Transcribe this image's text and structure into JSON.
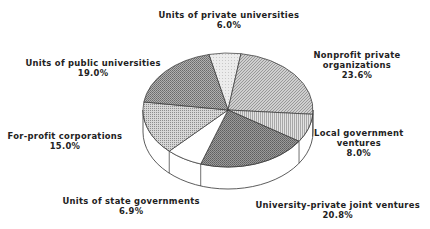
{
  "chart_data": {
    "type": "pie",
    "style": "3d",
    "title": "",
    "start_slice": "Units of private universities",
    "direction": "clockwise",
    "slices": [
      {
        "label": "Units of private universities",
        "value": 6.0,
        "display": "6.0%",
        "pattern": "light"
      },
      {
        "label": "Nonprofit private organizations",
        "value": 23.6,
        "display": "23.6%",
        "pattern": "fine-hatch"
      },
      {
        "label": "Local government ventures",
        "value": 8.0,
        "display": "8.0%",
        "pattern": "vertical-lines"
      },
      {
        "label": "University-private joint ventures",
        "value": 20.8,
        "display": "20.8%",
        "pattern": "dark-hatch"
      },
      {
        "label": "Units of state governments",
        "value": 6.9,
        "display": "6.9%",
        "pattern": "white"
      },
      {
        "label": "For-profit corporations",
        "value": 15.0,
        "display": "15.0%",
        "pattern": "dots"
      },
      {
        "label": "Units of public universities",
        "value": 19.0,
        "display": "19.0%",
        "pattern": "cross-hatch"
      }
    ],
    "label_lines": {
      "Units of private universities": [
        "Units of private universities"
      ],
      "Nonprofit private organizations": [
        "Nonprofit private",
        "organizations"
      ],
      "Local government ventures": [
        "Local government",
        "ventures"
      ],
      "University-private joint ventures": [
        "University-private joint ventures"
      ],
      "Units of state governments": [
        "Units of state governments"
      ],
      "For-profit corporations": [
        "For-profit corporations"
      ],
      "Units of public universities": [
        "Units of public universities"
      ]
    },
    "legend": "none"
  }
}
